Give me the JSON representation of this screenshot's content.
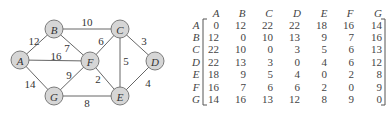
{
  "graph": {
    "nodes": [
      {
        "id": "A",
        "label": "A",
        "x": 20,
        "y": 60
      },
      {
        "id": "B",
        "label": "B",
        "x": 54,
        "y": 29
      },
      {
        "id": "C",
        "label": "C",
        "x": 120,
        "y": 29
      },
      {
        "id": "D",
        "label": "D",
        "x": 155,
        "y": 61
      },
      {
        "id": "E",
        "label": "E",
        "x": 120,
        "y": 96
      },
      {
        "id": "F",
        "label": "F",
        "x": 90,
        "y": 61
      },
      {
        "id": "G",
        "label": "G",
        "x": 54,
        "y": 96
      }
    ],
    "edges": [
      {
        "from": "A",
        "to": "B",
        "weight": "12",
        "lx": 34,
        "ly": 41
      },
      {
        "from": "A",
        "to": "F",
        "weight": "16",
        "lx": 56,
        "ly": 56
      },
      {
        "from": "A",
        "to": "G",
        "weight": "14",
        "lx": 30,
        "ly": 84
      },
      {
        "from": "B",
        "to": "C",
        "weight": "10",
        "lx": 87,
        "ly": 22
      },
      {
        "from": "B",
        "to": "F",
        "weight": "7",
        "lx": 67,
        "ly": 48
      },
      {
        "from": "C",
        "to": "F",
        "weight": "6",
        "lx": 101,
        "ly": 41
      },
      {
        "from": "C",
        "to": "E",
        "weight": "5",
        "lx": 126,
        "ly": 61
      },
      {
        "from": "C",
        "to": "D",
        "weight": "3",
        "lx": 144,
        "ly": 41
      },
      {
        "from": "F",
        "to": "G",
        "weight": "9",
        "lx": 69,
        "ly": 75
      },
      {
        "from": "F",
        "to": "E",
        "weight": "2",
        "lx": 98,
        "ly": 79
      },
      {
        "from": "D",
        "to": "E",
        "weight": "4",
        "lx": 148,
        "ly": 83
      },
      {
        "from": "G",
        "to": "E",
        "weight": "8",
        "lx": 87,
        "ly": 103
      }
    ],
    "node_radius": 9
  },
  "matrix": {
    "column_headers": [
      "A",
      "B",
      "C",
      "D",
      "E",
      "F",
      "G"
    ],
    "row_labels": [
      "A",
      "B",
      "C",
      "D",
      "E",
      "F",
      "G"
    ],
    "rows": [
      [
        "0",
        "12",
        "22",
        "22",
        "18",
        "16",
        "14"
      ],
      [
        "12",
        "0",
        "10",
        "13",
        "9",
        "7",
        "16"
      ],
      [
        "22",
        "10",
        "0",
        "3",
        "5",
        "6",
        "13"
      ],
      [
        "22",
        "13",
        "3",
        "0",
        "4",
        "6",
        "12"
      ],
      [
        "18",
        "9",
        "5",
        "4",
        "0",
        "2",
        "8"
      ],
      [
        "16",
        "7",
        "6",
        "6",
        "2",
        "0",
        "9"
      ],
      [
        "14",
        "16",
        "13",
        "12",
        "8",
        "9",
        "0"
      ]
    ]
  },
  "colors": {
    "node_fill": "#d6d6d6",
    "node_stroke": "#6e6e6e",
    "edge": "#555555",
    "text": "#333333"
  }
}
